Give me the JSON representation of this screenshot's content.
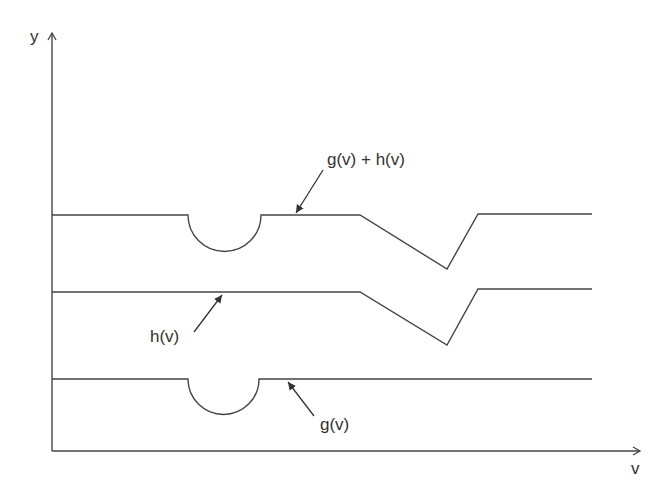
{
  "axes": {
    "y_label": "y",
    "x_label": "v"
  },
  "curves": [
    {
      "name": "g(v) + h(v)",
      "label": "g(v) + h(v)"
    },
    {
      "name": "h(v)",
      "label": "h(v)"
    },
    {
      "name": "g(v)",
      "label": "g(v)"
    }
  ],
  "colors": {
    "line": "#444444",
    "text": "#333333",
    "background": "#ffffff"
  }
}
